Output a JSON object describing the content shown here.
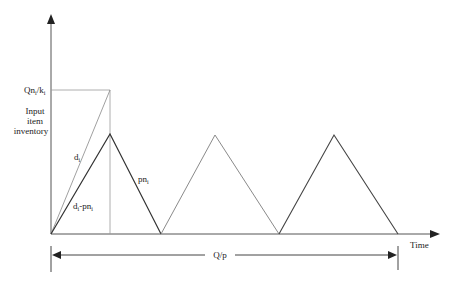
{
  "diagram": {
    "type": "inventory-cycle-diagram",
    "y_axis_label_lines": [
      "Input",
      "item",
      "inventory"
    ],
    "x_axis_label": "Time",
    "level_label": {
      "main": "Qn",
      "sub_i": "i",
      "sep": "/k",
      "sub_i2": "i"
    },
    "rise_label": {
      "main": "d",
      "sub": "i"
    },
    "net_rise_label": {
      "main": "d",
      "sub": "i",
      "mid": "-pn",
      "sub2": "i"
    },
    "fall_label": {
      "main": "pn",
      "sub": "i"
    },
    "span_label": "Q/p",
    "cycles": 3,
    "colors": {
      "axis": "#333333",
      "first_cycle": "#333333",
      "second_cycle": "#8a8a8a",
      "third_cycle": "#444444",
      "guide": "#999999",
      "dimension": "#333333"
    }
  }
}
